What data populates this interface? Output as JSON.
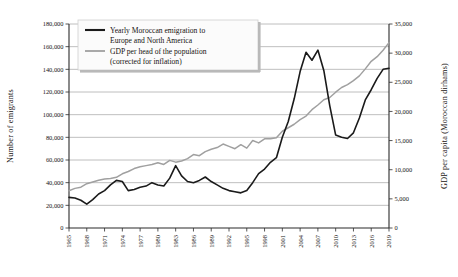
{
  "chart_data": {
    "type": "line",
    "title": "",
    "xlabel": "",
    "ylabel": "Number of emigrants",
    "y2label": "GDP per capita (Moroccan dirhams)",
    "grid": true,
    "legend_position": "top-left-inside",
    "xlim": [
      1965,
      2019
    ],
    "ylim": [
      0,
      180000
    ],
    "y2lim": [
      0,
      35000
    ],
    "xticks": [
      "1965",
      "1968",
      "1971",
      "1974",
      "1977",
      "1980",
      "1983",
      "1986",
      "1989",
      "1992",
      "1995",
      "1998",
      "2001",
      "2004",
      "2007",
      "2010",
      "2013",
      "2016",
      "2019"
    ],
    "yticks": [
      "0",
      "20,000",
      "40,000",
      "60,000",
      "80,000",
      "100,000",
      "120,000",
      "140,000",
      "160,000",
      "180,000"
    ],
    "y2ticks": [
      "0",
      "5,000",
      "10,000",
      "15,000",
      "20,000",
      "25,000",
      "30,000",
      "35,000"
    ],
    "x": [
      1965,
      1966,
      1967,
      1968,
      1969,
      1970,
      1971,
      1972,
      1973,
      1974,
      1975,
      1976,
      1977,
      1978,
      1979,
      1980,
      1981,
      1982,
      1983,
      1984,
      1985,
      1986,
      1987,
      1988,
      1989,
      1990,
      1991,
      1992,
      1993,
      1994,
      1995,
      1996,
      1997,
      1998,
      1999,
      2000,
      2001,
      2002,
      2003,
      2004,
      2005,
      2006,
      2007,
      2008,
      2009,
      2010,
      2011,
      2012,
      2013,
      2014,
      2015,
      2016,
      2017,
      2018,
      2019
    ],
    "series": [
      {
        "name": "Yearly Moroccan emigration to Europe and North America",
        "color": "#1a1a1a",
        "axis": "left",
        "units": "emigrants",
        "values": [
          27000,
          26500,
          24500,
          21000,
          25000,
          30000,
          33000,
          38000,
          42000,
          41000,
          33000,
          34000,
          36000,
          37000,
          40000,
          38000,
          37000,
          44000,
          55000,
          46000,
          41000,
          40000,
          42000,
          45000,
          41000,
          38000,
          35000,
          33000,
          32000,
          31000,
          33000,
          40000,
          48000,
          52000,
          58000,
          62000,
          80000,
          94000,
          114000,
          138000,
          155000,
          148000,
          157000,
          139000,
          108000,
          82000,
          80000,
          79000,
          84000,
          97000,
          113000,
          122000,
          132000,
          140000,
          141000
        ]
      },
      {
        "name": "GDP per head of the population (corrected for inflation)",
        "color": "#a0a0a0",
        "axis": "right",
        "units": "dirhams",
        "values": [
          6400,
          6800,
          7000,
          7600,
          7900,
          8200,
          8400,
          8500,
          8700,
          9300,
          9700,
          10200,
          10500,
          10700,
          10900,
          11200,
          10900,
          11600,
          11300,
          11500,
          11900,
          12600,
          12400,
          13100,
          13500,
          13800,
          14400,
          14000,
          13600,
          14300,
          13700,
          15000,
          14600,
          15300,
          15300,
          15500,
          16600,
          17200,
          17800,
          18600,
          19200,
          20300,
          21100,
          22000,
          22400,
          23300,
          24100,
          24600,
          25300,
          26100,
          27300,
          28600,
          29400,
          30500,
          31800
        ]
      }
    ]
  },
  "legend": {
    "items": [
      {
        "label_line1": "Yearly Moroccan emigration to",
        "label_line2": "Europe and North America",
        "color": "#1a1a1a"
      },
      {
        "label_line1": "GDP per head of the population",
        "label_line2": "(corrected for inflation)",
        "color": "#a0a0a0"
      }
    ]
  },
  "axes": {
    "left_title": "Number of emigrants",
    "right_title": "GDP per capita (Moroccan dirhams)"
  },
  "colors": {
    "emigration_line": "#1a1a1a",
    "gdp_line": "#a0a0a0",
    "grid": "#8a8a8a",
    "axis": "#2b2b2b",
    "background": "#ffffff"
  }
}
